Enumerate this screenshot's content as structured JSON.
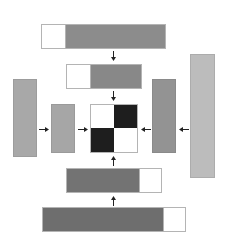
{
  "colors": {
    "background": "#ffffff",
    "white_cell": "#ffffff",
    "dark_gray": "#777777",
    "mid_gray": "#8f8f8f",
    "light_gray": "#a9a9a9",
    "lighter_gray": "#bdbdbd",
    "black_cell": "#1e1e1e",
    "border": "#b4b4b4",
    "arrow": "#222222"
  },
  "diagram": {
    "center_grid": {
      "cells": [
        "white",
        "black",
        "black",
        "white"
      ]
    },
    "top_bars": [
      {
        "id": "top-1",
        "segments": [
          "white",
          "gray"
        ]
      },
      {
        "id": "top-2",
        "segments": [
          "white",
          "gray"
        ]
      }
    ],
    "bottom_bars": [
      {
        "id": "bottom-1",
        "segments": [
          "gray",
          "white"
        ]
      },
      {
        "id": "bottom-2",
        "segments": [
          "gray",
          "white"
        ]
      }
    ],
    "left_bars": [
      {
        "id": "left-1",
        "shade": "light-gray"
      },
      {
        "id": "left-2",
        "shade": "light-gray"
      }
    ],
    "right_bars": [
      {
        "id": "right-1",
        "shade": "gray"
      },
      {
        "id": "right-2",
        "shade": "lighter-gray"
      }
    ],
    "arrows": [
      {
        "from": "top-1",
        "to": "top-2",
        "direction": "down"
      },
      {
        "from": "top-2",
        "to": "center",
        "direction": "down"
      },
      {
        "from": "left-1",
        "to": "left-2",
        "direction": "right"
      },
      {
        "from": "left-2",
        "to": "center",
        "direction": "right"
      },
      {
        "from": "right-2",
        "to": "right-1",
        "direction": "left"
      },
      {
        "from": "right-1",
        "to": "center",
        "direction": "left"
      },
      {
        "from": "bottom-2",
        "to": "bottom-1",
        "direction": "up"
      },
      {
        "from": "bottom-1",
        "to": "center",
        "direction": "up"
      }
    ]
  }
}
